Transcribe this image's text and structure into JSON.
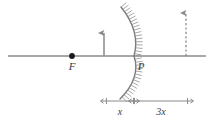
{
  "diagram": {
    "type": "ray-optics-concave-mirror",
    "colors": {
      "line": "#8a8a8a",
      "mirror": "#7a7a7a",
      "hatch": "#9a9a9a",
      "text": "#3a3a3a",
      "point": "#1a1a1a",
      "background": "#ffffff"
    },
    "axis": {
      "name": "principal-axis",
      "x1": 8,
      "y": 56,
      "x2": 206
    },
    "focal_point": {
      "label": "F",
      "x": 72,
      "y": 56,
      "label_x": 72,
      "label_y": 70
    },
    "vertex_point": {
      "label": "P",
      "x": 134,
      "y": 56,
      "label_x": 141,
      "label_y": 70
    },
    "object_arrow": {
      "name": "object-arrow",
      "x": 104,
      "y_base": 56,
      "y_tip": 33,
      "style": "solid"
    },
    "image_arrow": {
      "name": "image-arrow",
      "x": 186,
      "y_base": 56,
      "y_tip": 13,
      "style": "dashed"
    },
    "mirror": {
      "name": "concave-mirror",
      "vertex_x": 134,
      "vertex_y": 56,
      "top_x": 121,
      "top_y": 7,
      "bottom_x": 120,
      "bottom_y": 99,
      "hatch_side": "right",
      "hatch_count": 34,
      "hatch_length": 7
    },
    "dimension_line": {
      "name": "dimension-line",
      "y": 101,
      "x_start": 106,
      "x_mid": 134,
      "x_end": 188,
      "segments": [
        {
          "label": "x",
          "label_x": 120,
          "label_y": 115
        },
        {
          "label": "3x",
          "label_x": 161,
          "label_y": 115
        }
      ]
    }
  }
}
